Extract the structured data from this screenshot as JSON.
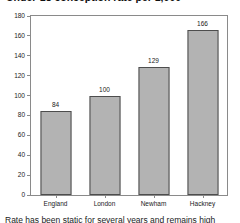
{
  "chart_data": {
    "type": "bar",
    "title": "Under-18 conception rate per 1,000",
    "subtitle": "",
    "xlabel": "",
    "ylabel": "",
    "categories": [
      "England",
      "London",
      "Newham",
      "Hackney"
    ],
    "values": [
      84,
      100,
      129,
      166
    ],
    "series": [
      {
        "name": "rate",
        "values": [
          84,
          100,
          129,
          166
        ]
      }
    ],
    "ylim": [
      0,
      180
    ],
    "ytick_values": [
      0,
      20,
      40,
      60,
      80,
      100,
      120,
      140,
      160,
      180
    ],
    "ytick_labels": [
      "0",
      "20",
      "40",
      "60",
      "80",
      "100",
      "120",
      "140",
      "160",
      "180"
    ],
    "grid": false,
    "legend": false,
    "legend_position": "none",
    "data_labels": [
      "84",
      "100",
      "129",
      "166"
    ],
    "bar_color": "#b3b3b3",
    "bar_edge_color": "#4d4d4d",
    "axis_color": "#8a8a8a",
    "background_color": "#ffffff"
  },
  "figure": {
    "title_clipped": "Under-18 conception rate per 1,000",
    "caption_clipped": "Rate has been static for several years and remains high"
  }
}
